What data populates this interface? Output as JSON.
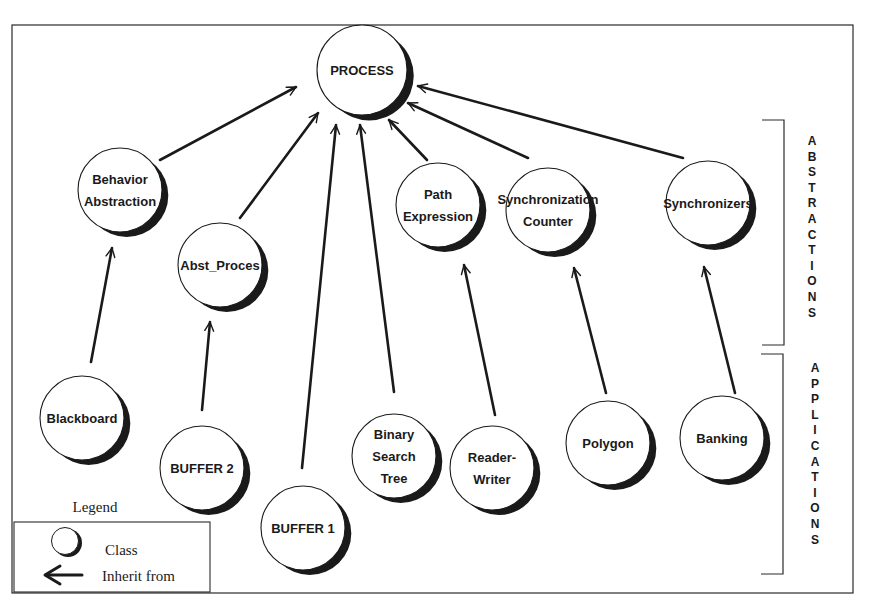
{
  "diagram": {
    "title": "",
    "colors": {
      "ink": "#1a1a1a",
      "paper": "#ffffff"
    },
    "frame": {
      "x": 12,
      "y": 25,
      "w": 841,
      "h": 568
    },
    "nodes": [
      {
        "id": "process",
        "lines": [
          "PROCESS"
        ],
        "cx": 362,
        "cy": 70,
        "r": 45,
        "group": "root"
      },
      {
        "id": "behavior-abstraction",
        "lines": [
          "Behavior",
          "Abstraction"
        ],
        "cx": 120,
        "cy": 190,
        "r": 42,
        "group": "abstractions"
      },
      {
        "id": "abst-proces",
        "lines": [
          "Abst_Proces"
        ],
        "cx": 220,
        "cy": 265,
        "r": 42,
        "group": "abstractions"
      },
      {
        "id": "path-expression",
        "lines": [
          "Path",
          "Expression"
        ],
        "cx": 438,
        "cy": 205,
        "r": 42,
        "group": "abstractions"
      },
      {
        "id": "synchronization-counter",
        "lines": [
          "Synchronization",
          "Counter"
        ],
        "cx": 548,
        "cy": 210,
        "r": 42,
        "group": "abstractions"
      },
      {
        "id": "synchronizers",
        "lines": [
          "Synchronizers"
        ],
        "cx": 708,
        "cy": 203,
        "r": 42,
        "group": "abstractions"
      },
      {
        "id": "blackboard",
        "lines": [
          "Blackboard"
        ],
        "cx": 82,
        "cy": 418,
        "r": 42,
        "group": "applications"
      },
      {
        "id": "buffer-2",
        "lines": [
          "BUFFER 2"
        ],
        "cx": 202,
        "cy": 468,
        "r": 42,
        "group": "applications"
      },
      {
        "id": "buffer-1",
        "lines": [
          "BUFFER 1"
        ],
        "cx": 303,
        "cy": 528,
        "r": 42,
        "group": "applications"
      },
      {
        "id": "binary-search-tree",
        "lines": [
          "Binary",
          "Search",
          "Tree"
        ],
        "cx": 394,
        "cy": 456,
        "r": 42,
        "group": "applications"
      },
      {
        "id": "reader-writer",
        "lines": [
          "Reader-",
          "Writer"
        ],
        "cx": 492,
        "cy": 468,
        "r": 42,
        "group": "applications"
      },
      {
        "id": "polygon",
        "lines": [
          "Polygon"
        ],
        "cx": 608,
        "cy": 443,
        "r": 42,
        "group": "applications"
      },
      {
        "id": "banking",
        "lines": [
          "Banking"
        ],
        "cx": 722,
        "cy": 438,
        "r": 42,
        "group": "applications"
      }
    ],
    "edges": [
      {
        "from": "behavior-abstraction",
        "to": "process",
        "x1": 160,
        "y1": 160,
        "x2": 296,
        "y2": 87
      },
      {
        "from": "abst-proces",
        "to": "process",
        "x1": 240,
        "y1": 218,
        "x2": 318,
        "y2": 113
      },
      {
        "from": "buffer-1",
        "to": "process",
        "x1": 302,
        "y1": 468,
        "x2": 336,
        "y2": 125
      },
      {
        "from": "binary-search-tree",
        "to": "process",
        "x1": 394,
        "y1": 392,
        "x2": 360,
        "y2": 125
      },
      {
        "from": "path-expression",
        "to": "process",
        "x1": 427,
        "y1": 160,
        "x2": 389,
        "y2": 120
      },
      {
        "from": "synchronization-counter",
        "to": "process",
        "x1": 528,
        "y1": 158,
        "x2": 408,
        "y2": 103
      },
      {
        "from": "synchronizers",
        "to": "process",
        "x1": 683,
        "y1": 158,
        "x2": 418,
        "y2": 86
      },
      {
        "from": "blackboard",
        "to": "behavior-abstraction",
        "x1": 91,
        "y1": 362,
        "x2": 112,
        "y2": 248
      },
      {
        "from": "buffer-2",
        "to": "abst-proces",
        "x1": 202,
        "y1": 410,
        "x2": 210,
        "y2": 322
      },
      {
        "from": "reader-writer",
        "to": "path-expression",
        "x1": 495,
        "y1": 415,
        "x2": 464,
        "y2": 265
      },
      {
        "from": "polygon",
        "to": "synchronization-counter",
        "x1": 606,
        "y1": 393,
        "x2": 574,
        "y2": 268
      },
      {
        "from": "banking",
        "to": "synchronizers",
        "x1": 735,
        "y1": 393,
        "x2": 704,
        "y2": 267
      }
    ],
    "side_labels": [
      {
        "id": "abstractions",
        "text": "ABSTRACTIONS",
        "x": 812,
        "y_start": 145,
        "step": 15.6,
        "bracket": {
          "x": 784,
          "y1": 120,
          "y2": 345,
          "tick": 22
        }
      },
      {
        "id": "applications",
        "text": "APPLICATIONS",
        "x": 815,
        "y_start": 372,
        "step": 15.6,
        "bracket": {
          "x": 783,
          "y1": 354,
          "y2": 574,
          "tick": 22
        }
      }
    ],
    "legend": {
      "title": "Legend",
      "title_x": 95,
      "title_y": 512,
      "box": {
        "x": 14,
        "y": 522,
        "w": 196,
        "h": 70
      },
      "items": [
        {
          "symbol": "class-circle",
          "label": "Class"
        },
        {
          "symbol": "inherit-arrow",
          "label": "Inherit from"
        }
      ]
    }
  }
}
